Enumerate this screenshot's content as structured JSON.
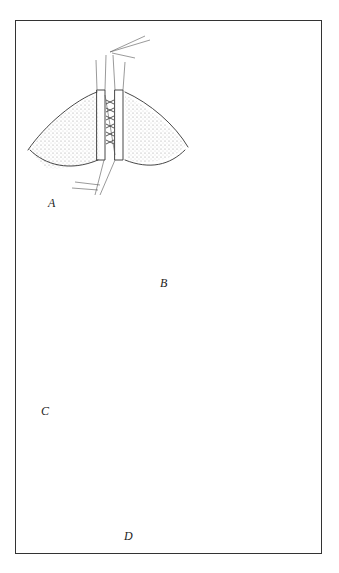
{
  "figure": {
    "type": "surgical-illustration",
    "panels": [
      {
        "id": "A",
        "label": "A",
        "description": "Tissue edges held with clamps, interrupted sutures placed along the midline"
      },
      {
        "id": "B",
        "label": "B",
        "description": "Continuous suture closing inner layer, curved needle and thread above"
      },
      {
        "id": "C",
        "label": "C",
        "description": "Closure progressing with stitched line and looped suture"
      },
      {
        "id": "D",
        "label": "D",
        "description": "Heart-shaped wound closure with magnified inset of suture pattern"
      }
    ],
    "inset": {
      "label": "magnified-suture-detail"
    }
  }
}
